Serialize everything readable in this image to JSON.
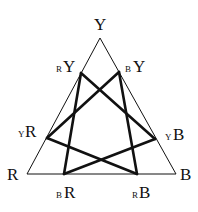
{
  "diagram": {
    "type": "triangle-color-mixing",
    "stroke_color": "#111111",
    "corners": {
      "Y": {
        "label": "Y",
        "x": 100,
        "y": 38
      },
      "R": {
        "label": "R",
        "x": 27,
        "y": 174
      },
      "B": {
        "label": "B",
        "x": 176,
        "y": 174
      }
    },
    "points": {
      "RY": {
        "prefix": "R",
        "main": "Y",
        "x": 81,
        "y": 73
      },
      "BY": {
        "prefix": "B",
        "main": "Y",
        "x": 119,
        "y": 72
      },
      "YR": {
        "prefix": "Y",
        "main": "R",
        "x": 47,
        "y": 138
      },
      "YB": {
        "prefix": "Y",
        "main": "B",
        "x": 155,
        "y": 139
      },
      "BR": {
        "prefix": "B",
        "main": "R",
        "x": 64,
        "y": 174
      },
      "RB": {
        "prefix": "R",
        "main": "B",
        "x": 137,
        "y": 174
      }
    },
    "connections": [
      [
        "RY",
        "YB"
      ],
      [
        "RY",
        "BR"
      ],
      [
        "BY",
        "YR"
      ],
      [
        "BY",
        "RB"
      ],
      [
        "YR",
        "RB"
      ],
      [
        "YB",
        "BR"
      ]
    ]
  }
}
